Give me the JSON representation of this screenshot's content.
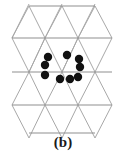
{
  "figure": {
    "caption": "(b)",
    "colors": {
      "background": "#ffffff",
      "lattice_line": "#a8a8a8",
      "lattice_line_dark": "#909090",
      "particle_fill": "#111111",
      "caption_text": "#1a1a1a"
    },
    "lattice": {
      "type": "triangular",
      "row_spacing": 33,
      "column_spacing": 33,
      "vertex_rows": [
        {
          "y": 6,
          "xs": [
            29,
            62,
            95
          ]
        },
        {
          "y": 38,
          "xs": [
            12,
            45,
            78,
            112
          ]
        },
        {
          "y": 72,
          "xs": [
            12,
            45,
            78,
            112
          ]
        },
        {
          "y": 105,
          "xs": [
            12,
            45,
            78,
            112
          ]
        },
        {
          "y": 133,
          "xs": [
            29,
            62,
            95
          ]
        }
      ],
      "horizontal_lines": [
        {
          "x1": 29,
          "x2": 95,
          "y": 6
        },
        {
          "x1": 12,
          "x2": 112,
          "y": 38
        },
        {
          "x1": 12,
          "x2": 112,
          "y": 72
        },
        {
          "x1": 12,
          "x2": 112,
          "y": 105
        },
        {
          "x1": 29,
          "x2": 95,
          "y": 133
        }
      ],
      "diagonal_lines": [
        {
          "x1": 29,
          "y1": 6,
          "x2": 12,
          "y2": 38
        },
        {
          "x1": 29,
          "y1": 6,
          "x2": 45,
          "y2": 38
        },
        {
          "x1": 62,
          "y1": 6,
          "x2": 45,
          "y2": 38
        },
        {
          "x1": 62,
          "y1": 6,
          "x2": 78,
          "y2": 38
        },
        {
          "x1": 95,
          "y1": 6,
          "x2": 78,
          "y2": 38
        },
        {
          "x1": 95,
          "y1": 6,
          "x2": 112,
          "y2": 38
        },
        {
          "x1": 12,
          "y1": 38,
          "x2": 29,
          "y2": 72
        },
        {
          "x1": 45,
          "y1": 38,
          "x2": 29,
          "y2": 72
        },
        {
          "x1": 45,
          "y1": 38,
          "x2": 62,
          "y2": 72
        },
        {
          "x1": 78,
          "y1": 38,
          "x2": 62,
          "y2": 72
        },
        {
          "x1": 78,
          "y1": 38,
          "x2": 95,
          "y2": 72
        },
        {
          "x1": 112,
          "y1": 38,
          "x2": 95,
          "y2": 72
        },
        {
          "x1": 29,
          "y1": 72,
          "x2": 12,
          "y2": 105
        },
        {
          "x1": 29,
          "y1": 72,
          "x2": 45,
          "y2": 105
        },
        {
          "x1": 62,
          "y1": 72,
          "x2": 45,
          "y2": 105
        },
        {
          "x1": 62,
          "y1": 72,
          "x2": 78,
          "y2": 105
        },
        {
          "x1": 95,
          "y1": 72,
          "x2": 78,
          "y2": 105
        },
        {
          "x1": 95,
          "y1": 72,
          "x2": 112,
          "y2": 105
        },
        {
          "x1": 12,
          "y1": 105,
          "x2": 29,
          "y2": 138
        },
        {
          "x1": 45,
          "y1": 105,
          "x2": 29,
          "y2": 138
        },
        {
          "x1": 45,
          "y1": 105,
          "x2": 62,
          "y2": 138
        },
        {
          "x1": 78,
          "y1": 105,
          "x2": 62,
          "y2": 138
        },
        {
          "x1": 78,
          "y1": 105,
          "x2": 95,
          "y2": 138
        },
        {
          "x1": 112,
          "y1": 105,
          "x2": 95,
          "y2": 138
        },
        {
          "x1": 12,
          "y1": 38,
          "x2": 29,
          "y2": 4
        },
        {
          "x1": 45,
          "y1": 38,
          "x2": 62,
          "y2": 4
        },
        {
          "x1": 78,
          "y1": 38,
          "x2": 95,
          "y2": 4
        },
        {
          "x1": 29,
          "y1": 72,
          "x2": 45,
          "y2": 38
        },
        {
          "x1": 62,
          "y1": 72,
          "x2": 78,
          "y2": 38
        }
      ]
    },
    "particles": {
      "count": 9,
      "radius": 4.2,
      "points": [
        {
          "id": "p1",
          "x": 48,
          "y": 57
        },
        {
          "id": "p2",
          "x": 67,
          "y": 55
        },
        {
          "id": "p3",
          "x": 79,
          "y": 59
        },
        {
          "id": "p4",
          "x": 45,
          "y": 65
        },
        {
          "id": "p5",
          "x": 80,
          "y": 67
        },
        {
          "id": "p6",
          "x": 45,
          "y": 75
        },
        {
          "id": "p7",
          "x": 60,
          "y": 79
        },
        {
          "id": "p8",
          "x": 70,
          "y": 79
        },
        {
          "id": "p9",
          "x": 78,
          "y": 77
        }
      ]
    }
  }
}
